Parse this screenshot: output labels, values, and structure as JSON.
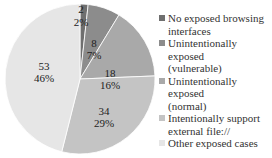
{
  "chart_data": {
    "type": "pie",
    "title": "",
    "start_angle_deg": 0,
    "direction": "clockwise",
    "slices": [
      {
        "label": "No exposed browsing interfaces",
        "value": 2,
        "percent": "2%",
        "color": "#6f6f6f"
      },
      {
        "label": "Unintentionally exposed (vulnerable)",
        "value": 8,
        "percent": "7%",
        "color": "#8c8c8c"
      },
      {
        "label": "Unintentionally exposed (normal)",
        "value": 18,
        "percent": "16%",
        "color": "#a9a9a9"
      },
      {
        "label": "Intentionally support external file://",
        "value": 34,
        "percent": "29%",
        "color": "#c4c4c4"
      },
      {
        "label": "Other exposed cases",
        "value": 53,
        "percent": "46%",
        "color": "#e6e6e6"
      }
    ],
    "legend_position": "right",
    "legend": [
      [
        "No exposed browsing",
        "interfaces"
      ],
      [
        "Unintentionally exposed",
        "(vulnerable)"
      ],
      [
        "Unintentionally exposed",
        "(normal)"
      ],
      [
        "Intentionally support",
        "external file://"
      ],
      [
        "Other exposed cases"
      ]
    ]
  }
}
